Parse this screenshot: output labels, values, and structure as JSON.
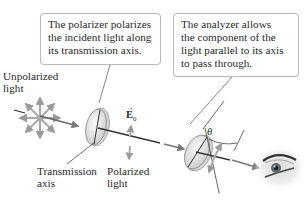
{
  "callouts": {
    "polarizer": {
      "lines": [
        "The polarizer polarizes",
        "the incident light along",
        "its transmission axis."
      ]
    },
    "analyzer": {
      "lines": [
        "The analyzer allows",
        "the component of the",
        "light parallel to its axis",
        "to pass through."
      ]
    }
  },
  "labels": {
    "unpolarized": [
      "Unpolarized",
      "light"
    ],
    "transmission_axis": [
      "Transmission",
      "axis"
    ],
    "polarized": [
      "Polarized",
      "light"
    ],
    "e_field": "E",
    "e_field_sub": "0",
    "angle": "θ"
  },
  "icons": {
    "light_source": "unpolarized-star-arrows-icon",
    "polarizer": "polarizer-disk-icon",
    "analyzer": "analyzer-disk-icon",
    "observer": "eye-icon"
  },
  "colors": {
    "arrow_gray": "#8c8c8c",
    "beam": "#555555",
    "disk_fill": "#e6e6e6",
    "callout_border": "#b9b9b9"
  }
}
